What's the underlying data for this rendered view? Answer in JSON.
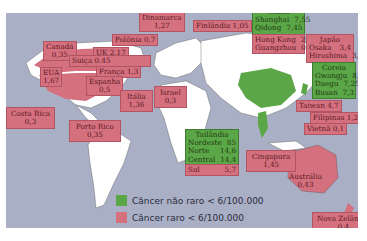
{
  "map": {
    "legend": [
      {
        "label": "Câncer não raro < 6/100.000",
        "color": "#5ba646"
      },
      {
        "label": "Câncer raro < 6/100.000",
        "color": "#d5707f"
      }
    ],
    "colors": {
      "ocean": "#a9afc5",
      "land": "#ffffff",
      "rare": "#d5707f",
      "common": "#5ba646"
    }
  },
  "labels": {
    "dinamarca": {
      "name": "Dinamarca",
      "value": "1,27"
    },
    "canada": {
      "name": "Canadá",
      "value": "0,35"
    },
    "polonia": {
      "text": "Polônia 0,7"
    },
    "uk": {
      "text": "UK 2,17"
    },
    "suica": {
      "text": "Suiça 0.45"
    },
    "eua": {
      "name": "EUA",
      "value": "1,67"
    },
    "franca": {
      "text": "França 1,3"
    },
    "espanha": {
      "name": "Espanha",
      "value": "0,5"
    },
    "italia": {
      "name": "Itália",
      "value": "1,36"
    },
    "israel": {
      "name": "Israel",
      "value": "0,3"
    },
    "costa_rica": {
      "name": "Costa Rica",
      "value": "0,3"
    },
    "porto_rico": {
      "name": "Porto Rico",
      "value": "0,35"
    },
    "finlandia": {
      "text": "Finlândia 1,05"
    },
    "china": {
      "name": "China",
      "rows": [
        {
          "city": "Shanghai",
          "value": "7,55"
        },
        {
          "city": "Qidong",
          "value": "7,45"
        }
      ]
    },
    "hongkong": {
      "rows": [
        {
          "city": "Hong Kong",
          "value": "2,25"
        },
        {
          "city": "Guangzhou",
          "value": "0,97"
        }
      ]
    },
    "japao": {
      "name": "Japão",
      "rows": [
        {
          "city": "Osaka",
          "value": "3,4"
        },
        {
          "city": "Hiroshima",
          "value": "3,05"
        }
      ]
    },
    "coreia": {
      "name": "Coreia",
      "rows": [
        {
          "city": "Gwangju",
          "value": "8,75"
        },
        {
          "city": "Daegu",
          "value": "7,25"
        },
        {
          "city": "Busan",
          "value": "7,3"
        }
      ]
    },
    "taiwan": {
      "text": "Taiwan 4,7"
    },
    "filipinas": {
      "text": "Filipinas 1,2"
    },
    "vietna": {
      "text": "Vietnã 0,1"
    },
    "tailandia": {
      "name": "Tailândia",
      "rows": [
        {
          "region": "Nordeste",
          "value": "85"
        },
        {
          "region": "Norte",
          "value": "14,6"
        },
        {
          "region": "Central",
          "value": "14,4"
        }
      ],
      "sul": {
        "region": "Sul",
        "value": "5,7"
      }
    },
    "cingapura": {
      "name": "Cingapura",
      "value": "1,45"
    },
    "australia": {
      "name": "Austrália",
      "value": "0,43"
    },
    "nova_zelandia": {
      "name": "Nova Zelândia",
      "value": "0,4"
    }
  }
}
